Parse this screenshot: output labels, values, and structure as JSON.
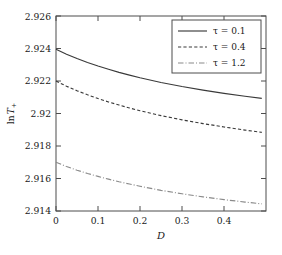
{
  "chart_data": {
    "type": "line",
    "title": "",
    "xlabel": "D",
    "ylabel": "ln T+",
    "xlim": [
      0,
      0.5
    ],
    "ylim": [
      2.914,
      2.926
    ],
    "grid": false,
    "legend_position": "top-right",
    "xticks": [
      "0",
      "0.1",
      "0.2",
      "0.3",
      "0.4"
    ],
    "xtick_values": [
      0,
      0.1,
      0.2,
      0.3,
      0.4
    ],
    "yticks": [
      "2.914",
      "2.916",
      "2.918",
      "2.92",
      "2.922",
      "2.924",
      "2.926"
    ],
    "ytick_values": [
      2.914,
      2.916,
      2.918,
      2.92,
      2.922,
      2.924,
      2.926
    ],
    "x": [
      0,
      0.025,
      0.05,
      0.075,
      0.1,
      0.125,
      0.15,
      0.175,
      0.2,
      0.25,
      0.3,
      0.35,
      0.4,
      0.45,
      0.49
    ],
    "series": [
      {
        "name": "tau = 0.1",
        "legend": "τ = 0.1",
        "style": "solid",
        "values": [
          2.92395,
          2.92365,
          2.92338,
          2.92314,
          2.92292,
          2.92272,
          2.92253,
          2.92236,
          2.9222,
          2.92191,
          2.92166,
          2.92144,
          2.92124,
          2.92106,
          2.92093
        ]
      },
      {
        "name": "tau = 0.4",
        "legend": "τ = 0.4",
        "style": "dashed",
        "values": [
          2.922,
          2.92168,
          2.9214,
          2.92115,
          2.92092,
          2.92071,
          2.92052,
          2.92034,
          2.92017,
          2.91987,
          2.91961,
          2.91938,
          2.91917,
          2.91898,
          2.91884
        ]
      },
      {
        "name": "tau = 1.2",
        "legend": "τ = 1.2",
        "style": "dashdot",
        "values": [
          2.917,
          2.91674,
          2.91651,
          2.91631,
          2.91613,
          2.91596,
          2.9158,
          2.91566,
          2.91552,
          2.91527,
          2.91506,
          2.91487,
          2.9147,
          2.91455,
          2.91444
        ]
      }
    ],
    "colors": {
      "solid": "#3a3a3a",
      "dashed": "#3a3a3a",
      "dashdot": "#8a8a8a",
      "axis": "#4d4d4d",
      "background": "#ffffff"
    }
  }
}
